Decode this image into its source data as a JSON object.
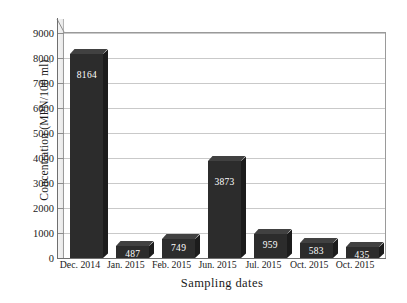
{
  "chart_data": {
    "type": "bar",
    "title": "",
    "xlabel": "Sampling dates",
    "ylabel": "Concentration (MPN/100 ml)",
    "categories": [
      "Dec. 2014",
      "Jan. 2015",
      "Feb. 2015",
      "Jun. 2015",
      "Jul. 2015",
      "Oct. 2015",
      "Oct. 2015"
    ],
    "values": [
      8164,
      487,
      749,
      3873,
      959,
      583,
      435
    ],
    "value_labels": [
      "8164",
      "487",
      "749",
      "3873",
      "959",
      "583",
      "435"
    ],
    "ylim": [
      0,
      9000
    ],
    "ytick_labels": [
      "0",
      "1000",
      "2000",
      "3000",
      "4000",
      "5000",
      "6000",
      "7000",
      "8000",
      "9000"
    ],
    "ytick_values": [
      0,
      1000,
      2000,
      3000,
      4000,
      5000,
      6000,
      7000,
      8000,
      9000
    ],
    "grid": "horizontal",
    "legend": "none",
    "style": "3d-column",
    "colors": {
      "bar_face": "#2c2c2c",
      "bar_top": "#414141",
      "bar_side": "#1c1c1c",
      "value_text": "#ffffff",
      "gridline": "#c9c9c9",
      "axis": "#6f6f6f",
      "background": "#ffffff"
    }
  }
}
